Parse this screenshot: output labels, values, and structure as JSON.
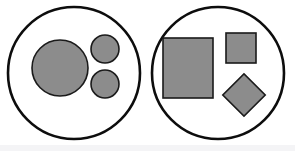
{
  "diagram": {
    "canvas": {
      "width": 295,
      "height": 151,
      "background": "#ffffff"
    },
    "palette": {
      "shape_fill": "#8c8c8c",
      "shape_stroke": "#1a1a1a",
      "container_stroke": "#0d0d0d",
      "container_fill": "#ffffff",
      "bottom_strip": "#f4f4f6"
    },
    "groups": [
      {
        "id": "left-set",
        "name": "left-circle-container",
        "shape": "circle",
        "cx": 74,
        "cy": 73,
        "r": 66,
        "stroke_width": 2.6,
        "members": [
          {
            "id": "left-big-circle",
            "name": "large-gray-circle",
            "shape": "circle",
            "cx": 60,
            "cy": 68,
            "r": 28,
            "stroke_width": 1.6,
            "size_label": "large"
          },
          {
            "id": "left-small-circle-top",
            "name": "small-gray-circle-top",
            "shape": "circle",
            "cx": 105,
            "cy": 49,
            "r": 14,
            "stroke_width": 1.6,
            "size_label": "small"
          },
          {
            "id": "left-small-circle-bottom",
            "name": "small-gray-circle-bottom",
            "shape": "circle",
            "cx": 105,
            "cy": 84,
            "r": 14,
            "stroke_width": 1.6,
            "size_label": "small"
          }
        ]
      },
      {
        "id": "right-set",
        "name": "right-circle-container",
        "shape": "circle",
        "cx": 218,
        "cy": 73,
        "r": 66,
        "stroke_width": 2.6,
        "members": [
          {
            "id": "right-big-square",
            "name": "large-gray-square",
            "shape": "rect",
            "x": 163,
            "y": 38,
            "width": 50,
            "height": 60,
            "rotation": 0,
            "stroke_width": 1.6,
            "size_label": "large"
          },
          {
            "id": "right-small-square",
            "name": "small-gray-square",
            "shape": "rect",
            "x": 226,
            "y": 33,
            "width": 30,
            "height": 30,
            "rotation": 0,
            "stroke_width": 1.6,
            "size_label": "small"
          },
          {
            "id": "right-diamond",
            "name": "gray-diamond-square",
            "shape": "rect",
            "x": 229,
            "y": 80,
            "width": 30,
            "height": 30,
            "rotation": 45,
            "stroke_width": 1.6,
            "size_label": "small-rotated"
          }
        ]
      }
    ]
  }
}
